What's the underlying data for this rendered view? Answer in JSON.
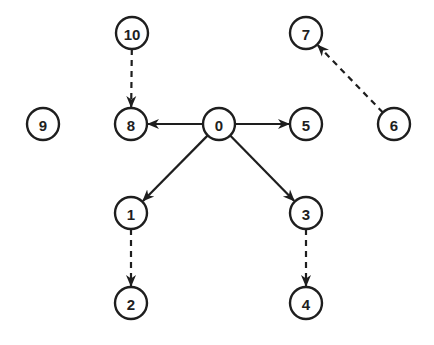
{
  "diagram": {
    "type": "directed-graph",
    "node_radius": 16,
    "stroke_color": "#1e1e1e",
    "nodes": [
      {
        "id": "0",
        "label": "0",
        "x": 219,
        "y": 124
      },
      {
        "id": "1",
        "label": "1",
        "x": 131,
        "y": 213
      },
      {
        "id": "2",
        "label": "2",
        "x": 131,
        "y": 303
      },
      {
        "id": "3",
        "label": "3",
        "x": 306,
        "y": 213
      },
      {
        "id": "4",
        "label": "4",
        "x": 306,
        "y": 303
      },
      {
        "id": "5",
        "label": "5",
        "x": 306,
        "y": 124
      },
      {
        "id": "6",
        "label": "6",
        "x": 394,
        "y": 124
      },
      {
        "id": "7",
        "label": "7",
        "x": 306,
        "y": 33
      },
      {
        "id": "8",
        "label": "8",
        "x": 131,
        "y": 124
      },
      {
        "id": "9",
        "label": "9",
        "x": 43,
        "y": 124
      },
      {
        "id": "10",
        "label": "10",
        "x": 132,
        "y": 33
      }
    ],
    "edges": [
      {
        "from": "0",
        "to": "8",
        "style": "solid"
      },
      {
        "from": "0",
        "to": "5",
        "style": "solid"
      },
      {
        "from": "0",
        "to": "1",
        "style": "solid"
      },
      {
        "from": "0",
        "to": "3",
        "style": "solid"
      },
      {
        "from": "10",
        "to": "8",
        "style": "dashed"
      },
      {
        "from": "6",
        "to": "7",
        "style": "dashed"
      },
      {
        "from": "1",
        "to": "2",
        "style": "dashed"
      },
      {
        "from": "3",
        "to": "4",
        "style": "dashed"
      }
    ]
  }
}
